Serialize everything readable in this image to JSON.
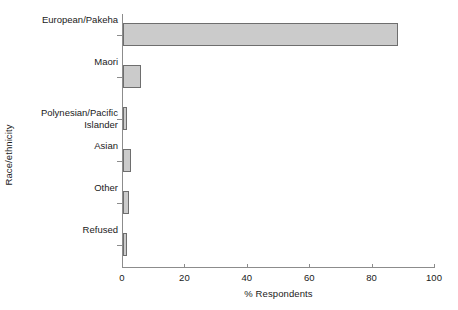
{
  "chart_data": {
    "type": "bar",
    "orientation": "horizontal",
    "title": "",
    "xlabel": "% Respondents",
    "ylabel": "Race/ethnicity",
    "categories": [
      "European/Pakeha",
      "Maori",
      "Polynesian/Pacific\nIslander",
      "Asian",
      "Other",
      "Refused"
    ],
    "values": [
      88,
      5.8,
      1.2,
      2.5,
      1.8,
      1.3
    ],
    "xlim": [
      0,
      100
    ],
    "xticks": [
      0,
      20,
      40,
      60,
      80,
      100
    ],
    "xtick_labels": [
      "0",
      "20",
      "40",
      "60",
      "80",
      "100"
    ],
    "grid": false,
    "legend": false,
    "bar_fill_color": "#cbcbcb",
    "bar_border_color": "#6e6e6e",
    "axis_color": "#8c8c8c",
    "background_color": "#ffffff"
  }
}
